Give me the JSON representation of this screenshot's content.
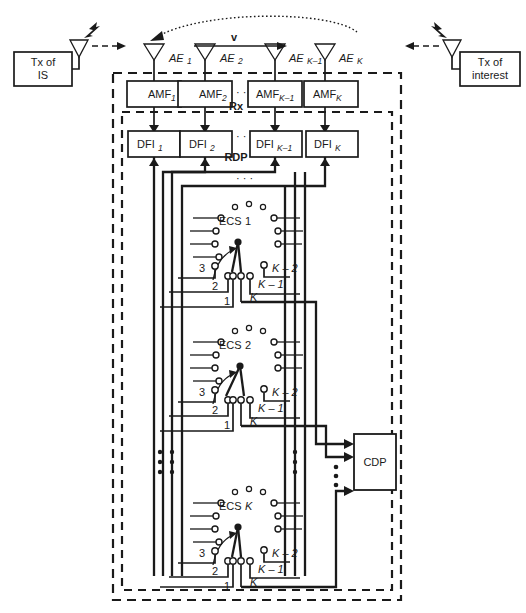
{
  "diagram": {
    "colors": {
      "ink": "#1a1a1a",
      "paper": "#ffffff"
    },
    "left_source": {
      "label_line1": "Tx of",
      "label_line2": "IS",
      "icon": "antenna-icon"
    },
    "right_source": {
      "label_line1": "Tx of",
      "label_line2": "interest",
      "icon": "antenna-icon"
    },
    "velocity_label": "v",
    "antenna_elements": [
      {
        "prefix": "AE",
        "index": "1"
      },
      {
        "prefix": "AE",
        "index": "2"
      },
      {
        "prefix": "AE",
        "index": "K–1"
      },
      {
        "prefix": "AE",
        "index": "K"
      }
    ],
    "amplifiers": [
      {
        "prefix": "AMF",
        "index": "1"
      },
      {
        "prefix": "AMF",
        "index": "2"
      },
      {
        "prefix": "AMF",
        "index": "K–1"
      },
      {
        "prefix": "AMF",
        "index": "K"
      }
    ],
    "digital_filters": [
      {
        "prefix": "DFI",
        "index": "1"
      },
      {
        "prefix": "DFI",
        "index": "2"
      },
      {
        "prefix": "DFI",
        "index": "K–1"
      },
      {
        "prefix": "DFI",
        "index": "K"
      }
    ],
    "frame_rx_label": "Rx",
    "frame_rdp_label": "RDP",
    "ellipsis_horizontal": "· · ·",
    "switches": [
      {
        "name_prefix": "ECS",
        "name_index": "1",
        "terminals": [
          "3",
          "2",
          "1",
          "K – 2",
          "K – 1",
          "K"
        ]
      },
      {
        "name_prefix": "ECS",
        "name_index": "2",
        "terminals": [
          "3",
          "2",
          "1",
          "K – 2",
          "K – 1",
          "K"
        ]
      },
      {
        "name_prefix": "ECS",
        "name_index": "K",
        "terminals": [
          "3",
          "2",
          "1",
          "K – 2",
          "K – 1",
          "K"
        ]
      }
    ],
    "processor": {
      "label": "CDP"
    }
  }
}
